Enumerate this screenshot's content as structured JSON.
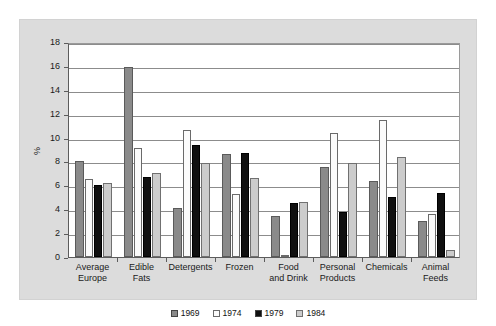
{
  "header": {
    "faint_text": ""
  },
  "axis": {
    "y_title": "%",
    "y_ticks": [
      "0",
      "2",
      "4",
      "6",
      "8",
      "10",
      "12",
      "14",
      "16",
      "18"
    ]
  },
  "legend": {
    "items": [
      {
        "label": "1969",
        "color": "#8a8a8a"
      },
      {
        "label": "1974",
        "color": "#fbfbfb"
      },
      {
        "label": "1979",
        "color": "#101010"
      },
      {
        "label": "1984",
        "color": "#cccccc"
      }
    ]
  },
  "chart_data": {
    "type": "bar",
    "title": "",
    "xlabel": "",
    "ylabel": "%",
    "ylim": [
      0,
      18
    ],
    "ytick_step": 2,
    "grid": true,
    "legend_position": "bottom",
    "categories": [
      "Average\nEurope",
      "Edible\nFats",
      "Detergents",
      "Frozen",
      "Food\nand Drink",
      "Personal\nProducts",
      "Chemicals",
      "Animal\nFeeds"
    ],
    "series": [
      {
        "name": "1969",
        "color": "#8a8a8a",
        "values": [
          8.0,
          15.9,
          4.1,
          8.6,
          3.4,
          7.5,
          6.4,
          3.0
        ]
      },
      {
        "name": "1974",
        "color": "#fbfbfb",
        "values": [
          6.5,
          9.1,
          10.6,
          5.3,
          0.1,
          10.4,
          11.5,
          3.6
        ]
      },
      {
        "name": "1979",
        "color": "#101010",
        "values": [
          6.0,
          6.7,
          9.4,
          8.7,
          4.5,
          3.8,
          5.0,
          5.4
        ]
      },
      {
        "name": "1984",
        "color": "#cccccc",
        "values": [
          6.2,
          7.0,
          7.9,
          6.6,
          4.6,
          7.9,
          8.4,
          0.6
        ]
      }
    ]
  }
}
